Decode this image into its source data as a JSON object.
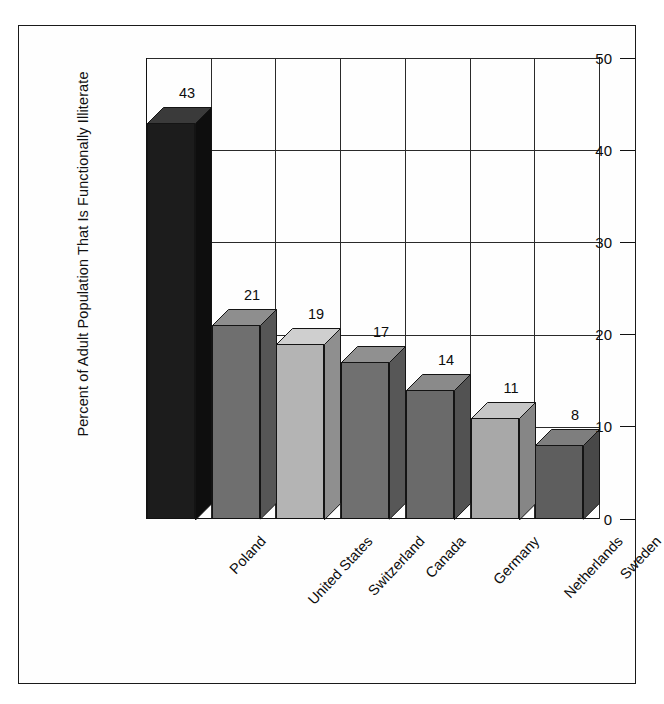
{
  "chart_data": {
    "type": "bar",
    "title": "",
    "subtitle": "",
    "xlabel": "",
    "ylabel": "Percent of Adult Population That Is Functionally Illiterate",
    "categories": [
      "Poland",
      "United States",
      "Switzerland",
      "Canada",
      "Germany",
      "Netherlands",
      "Sweden"
    ],
    "values": [
      43,
      21,
      19,
      17,
      14,
      11,
      8
    ],
    "value_labels": [
      "43",
      "21",
      "19",
      "17",
      "14",
      "11",
      "8"
    ],
    "ylim": [
      0,
      50
    ],
    "ytick_values": [
      50,
      40,
      30,
      20,
      10,
      0
    ],
    "ytick_labels": [
      "50",
      "40",
      "30",
      "20",
      "10",
      "0"
    ],
    "grid": "horizontal-and-vertical",
    "legend": "none",
    "style": "3d-columns",
    "bar_colors": [
      "#1c1c1c",
      "#6f6f6f",
      "#b4b4b4",
      "#707070",
      "#6a6a6a",
      "#a8a8a8",
      "#5e5e5e"
    ],
    "bar_top_colors": [
      "#3a3a3a",
      "#8e8e8e",
      "#cfcfcf",
      "#909090",
      "#8a8a8a",
      "#c6c6c6",
      "#7e7e7e"
    ],
    "bar_side_colors": [
      "#0e0e0e",
      "#565656",
      "#8f8f8f",
      "#575757",
      "#525252",
      "#868686",
      "#484848"
    ],
    "axis_color": "#111111",
    "grid_color": "#2a2a2a",
    "text_color": "#0d0d0d",
    "background": "#ffffff"
  }
}
